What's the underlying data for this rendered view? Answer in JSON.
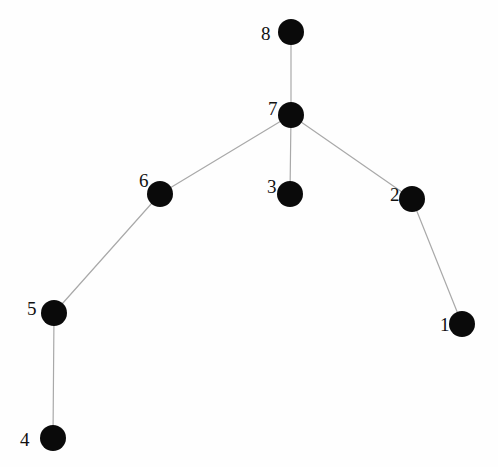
{
  "figure": {
    "kind": "node-link-graph",
    "background_color": "#fefefe",
    "node_color": "#0a0a0a",
    "edge_color": "#a9a9a9",
    "label_color": "#111111",
    "node_radius": 13,
    "edge_width": 1.2,
    "width": 498,
    "height": 467
  },
  "graph_data": {
    "type": "graph",
    "layout": "tree",
    "directed": false,
    "node_count": 8,
    "edge_count": 7,
    "nodes": [
      {
        "id": "1",
        "label": "1",
        "x": 462,
        "y": 324,
        "label_x": 440,
        "label_y": 315,
        "degree": 1
      },
      {
        "id": "2",
        "label": "2",
        "x": 412,
        "y": 199,
        "label_x": 390,
        "label_y": 185,
        "degree": 2
      },
      {
        "id": "3",
        "label": "3",
        "x": 290,
        "y": 194,
        "label_x": 267,
        "label_y": 177,
        "degree": 1
      },
      {
        "id": "4",
        "label": "4",
        "x": 53,
        "y": 438,
        "label_x": 20,
        "label_y": 430,
        "degree": 1
      },
      {
        "id": "5",
        "label": "5",
        "x": 54,
        "y": 313,
        "label_x": 27,
        "label_y": 299,
        "degree": 2
      },
      {
        "id": "6",
        "label": "6",
        "x": 160,
        "y": 194,
        "label_x": 139,
        "label_y": 171,
        "degree": 2
      },
      {
        "id": "7",
        "label": "7",
        "x": 291,
        "y": 115,
        "label_x": 268,
        "label_y": 99,
        "degree": 4
      },
      {
        "id": "8",
        "label": "8",
        "x": 291,
        "y": 32,
        "label_x": 261,
        "label_y": 24,
        "degree": 1
      }
    ],
    "edges": [
      {
        "source": "8",
        "target": "7"
      },
      {
        "source": "7",
        "target": "6"
      },
      {
        "source": "7",
        "target": "3"
      },
      {
        "source": "7",
        "target": "2"
      },
      {
        "source": "6",
        "target": "5"
      },
      {
        "source": "5",
        "target": "4"
      },
      {
        "source": "2",
        "target": "1"
      }
    ]
  }
}
